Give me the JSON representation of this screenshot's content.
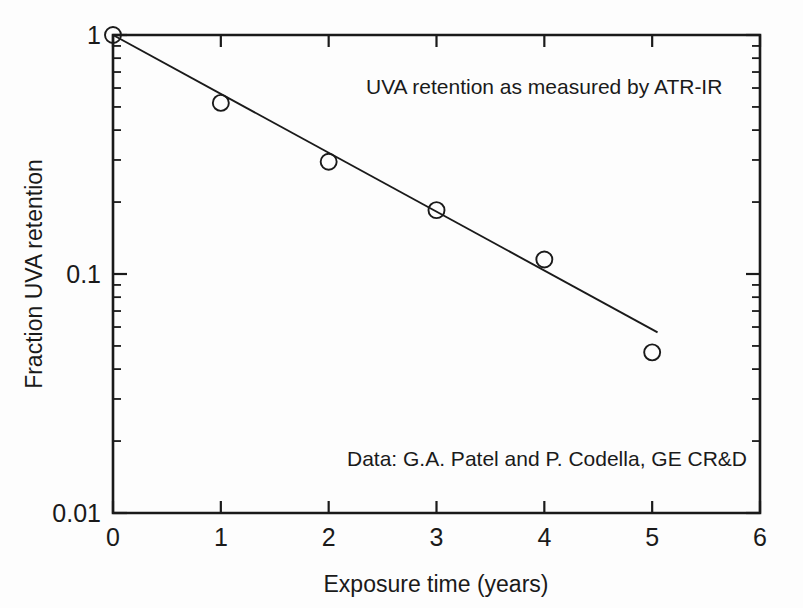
{
  "chart_data": {
    "type": "scatter",
    "title": "",
    "xlabel": "Exposure time (years)",
    "ylabel": "Fraction UVA retention",
    "xlim": [
      0,
      6
    ],
    "ylim": [
      0.01,
      1
    ],
    "yscale": "log",
    "xscale": "linear",
    "grid": false,
    "legend": "none",
    "x_ticks": [
      "0",
      "1",
      "2",
      "3",
      "4",
      "5",
      "6"
    ],
    "x_tick_values": [
      0,
      1,
      2,
      3,
      4,
      5,
      6
    ],
    "y_ticks": [
      "1",
      "0.1",
      "0.01"
    ],
    "y_tick_values": [
      1,
      0.1,
      0.01
    ],
    "series": [
      {
        "name": "UVA retention",
        "marker": "open-circle",
        "x": [
          0,
          1,
          2,
          3,
          4,
          5
        ],
        "values": [
          1.0,
          0.52,
          0.295,
          0.185,
          0.115,
          0.047
        ]
      },
      {
        "name": "Exponential fit",
        "marker": "line",
        "x": [
          0,
          5.05
        ],
        "values": [
          1.0,
          0.057
        ]
      }
    ],
    "annotations": [
      {
        "text": "UVA retention as measured by ATR-IR",
        "x": 2.25,
        "y": 0.62
      },
      {
        "text": "Data: G.A. Patel and P. Codella, GE CR&D",
        "x": 2.1,
        "y": 0.0185
      }
    ]
  },
  "axes": {
    "x_axis_title": "Exposure time (years)",
    "y_axis_title": "Fraction UVA retention",
    "x_tick_labels": [
      "0",
      "1",
      "2",
      "3",
      "4",
      "5",
      "6"
    ],
    "y_tick_labels": [
      "1",
      "0.1",
      "0.01"
    ]
  },
  "annotations": {
    "method_note": "UVA retention as measured by ATR-IR",
    "source_note": "Data: G.A. Patel and P. Codella, GE CR&D"
  },
  "colors": {
    "ink": "#1a1a1a",
    "background": "#fdfdfd"
  }
}
